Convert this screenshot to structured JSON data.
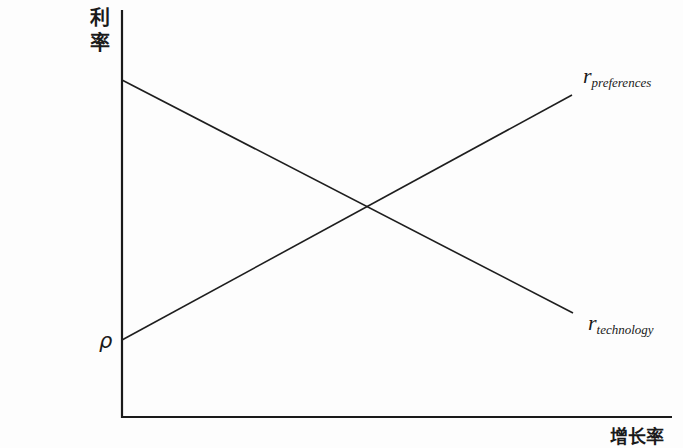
{
  "diagram": {
    "y_axis_label_chars": [
      "利",
      "率"
    ],
    "x_axis_label": "增长率",
    "intercept_label": "ρ",
    "curves": [
      {
        "name": "preferences",
        "label_main": "r",
        "label_sub": "preferences",
        "slope": "upward",
        "start": [
          122,
          340
        ],
        "end": [
          572,
          95
        ]
      },
      {
        "name": "technology",
        "label_main": "r",
        "label_sub": "technology",
        "slope": "downward",
        "start": [
          122,
          80
        ],
        "end": [
          573,
          313
        ]
      }
    ],
    "axes": {
      "origin": [
        122,
        417
      ],
      "y_top": [
        122,
        10
      ],
      "x_right": [
        672,
        417
      ]
    },
    "intersection": [
      365,
      207
    ],
    "colors": {
      "line": "#1e1e1e",
      "axis": "#1a1a1a",
      "background": "#fdfdfd"
    }
  },
  "chart_data": {
    "type": "line",
    "title": "",
    "xlabel": "增长率",
    "ylabel": "利率",
    "series": [
      {
        "name": "r_preferences",
        "description": "Upward-sloping line starting at intercept ρ on the interest-rate axis",
        "x": [
          0,
          1
        ],
        "y": [
          0.19,
          0.79
        ]
      },
      {
        "name": "r_technology",
        "description": "Downward-sloping line starting high on the interest-rate axis",
        "x": [
          0,
          1
        ],
        "y": [
          0.83,
          0.26
        ]
      }
    ],
    "annotations": [
      {
        "text": "ρ",
        "position": "y-intercept of r_preferences"
      },
      {
        "text": "r_preferences",
        "position": "right end of upward line"
      },
      {
        "text": "r_technology",
        "position": "right end of downward line"
      }
    ],
    "intersection": {
      "x": 0.54,
      "y": 0.53
    },
    "grid": false,
    "ticks": "none",
    "legend": "inline labels at line ends"
  }
}
